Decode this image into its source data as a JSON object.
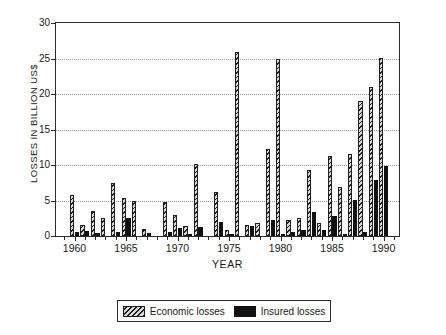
{
  "chart_data": {
    "type": "bar",
    "title": "",
    "xlabel": "YEAR",
    "ylabel": "LOSSES IN BILLION US$",
    "ylim": [
      0,
      30
    ],
    "xlim": [
      1958.2,
      1991.5
    ],
    "yticks": [
      0,
      5,
      10,
      15,
      20,
      25,
      30
    ],
    "ytick_labels": [
      "0",
      "5",
      "10",
      "15",
      "20",
      "25",
      "30"
    ],
    "xticks": [
      1960,
      1965,
      1970,
      1975,
      1980,
      1985,
      1990
    ],
    "xtick_labels": [
      "1960",
      "1965",
      "1970",
      "1975",
      "1980",
      "1985",
      "1990"
    ],
    "xminor_ticks": [
      1959,
      1961,
      1962,
      1963,
      1964,
      1966,
      1967,
      1968,
      1969,
      1971,
      1972,
      1973,
      1974,
      1976,
      1977,
      1978,
      1979,
      1981,
      1982,
      1983,
      1984,
      1986,
      1987,
      1988,
      1989,
      1991
    ],
    "grid": "horizontal-dotted",
    "legend_position": "below-axes",
    "categories": [
      1960,
      1961,
      1962,
      1963,
      1964,
      1965,
      1966,
      1967,
      1968,
      1969,
      1970,
      1971,
      1972,
      1973,
      1974,
      1975,
      1976,
      1977,
      1978,
      1979,
      1980,
      1981,
      1982,
      1983,
      1984,
      1985,
      1986,
      1987,
      1988,
      1989,
      1990
    ],
    "series": [
      {
        "name": "Economic losses",
        "color": "#d8d8d8",
        "pattern": "diagonal-hatch",
        "values": [
          5.8,
          1.5,
          3.5,
          2.5,
          7.5,
          5.3,
          4.9,
          1.0,
          0.0,
          4.8,
          3.0,
          1.4,
          10.1,
          0.0,
          6.2,
          0.9,
          25.9,
          1.6,
          1.8,
          12.3,
          24.9,
          2.3,
          2.6,
          9.3,
          1.9,
          11.3,
          6.9,
          11.5,
          19.0,
          21.0,
          25.1
        ]
      },
      {
        "name": "Insured losses",
        "color": "#111111",
        "pattern": "solid",
        "values": [
          0.6,
          0.7,
          0.4,
          0.0,
          0.6,
          2.5,
          0.0,
          0.4,
          0.0,
          0.6,
          1.1,
          0.2,
          1.2,
          0.0,
          2.0,
          0.1,
          0.0,
          1.4,
          0.0,
          2.2,
          0.1,
          0.5,
          0.9,
          3.4,
          0.9,
          2.8,
          0.1,
          5.1,
          0.6,
          7.9,
          9.9
        ]
      }
    ]
  },
  "legend": {
    "items": [
      {
        "label": "Economic losses",
        "swatch": "hatched-swatch"
      },
      {
        "label": "Insured losses",
        "swatch": "solid-black-swatch"
      }
    ]
  }
}
